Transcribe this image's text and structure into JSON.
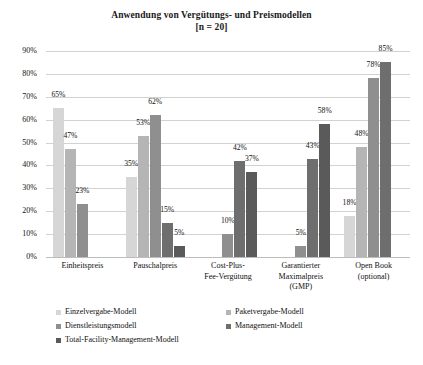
{
  "chart_data": {
    "type": "bar",
    "title": "Anwendung von Vergütungs- und Preismodellen",
    "subtitle": "[n = 20]",
    "xlabel": "",
    "ylabel": "",
    "ylim": [
      0,
      90
    ],
    "ytick_labels": [
      "0%",
      "10%",
      "20%",
      "30%",
      "40%",
      "50%",
      "60%",
      "70%",
      "80%",
      "90%"
    ],
    "ytick_values": [
      0,
      10,
      20,
      30,
      40,
      50,
      60,
      70,
      80,
      90
    ],
    "grid": true,
    "legend_position": "bottom",
    "categories": [
      "Einheitspreis",
      "Pauschalpreis",
      "Cost-Plus-\nFee-Vergütung",
      "Garantierter\nMaximalpreis\n(GMP)",
      "Open Book\n(optional)"
    ],
    "category_lines": [
      [
        "Einheitspreis"
      ],
      [
        "Pauschalpreis"
      ],
      [
        "Cost-Plus-",
        "Fee-Vergütung"
      ],
      [
        "Garantierter",
        "Maximalpreis",
        "(GMP)"
      ],
      [
        "Open Book",
        "(optional)"
      ]
    ],
    "series": [
      {
        "name": "Einzelvergabe-Modell",
        "color": "#d6d6d6",
        "values": [
          65,
          35,
          null,
          null,
          18
        ]
      },
      {
        "name": "Paketvergabe-Modell",
        "color": "#b5b5b5",
        "values": [
          47,
          53,
          null,
          null,
          48
        ]
      },
      {
        "name": "Dienstleistungsmodell",
        "color": "#8f8f8f",
        "values": [
          23,
          62,
          10,
          5,
          78
        ]
      },
      {
        "name": "Management-Modell",
        "color": "#6e6e6e",
        "values": [
          null,
          15,
          42,
          43,
          85
        ]
      },
      {
        "name": "Total-Facility-Management-Modell",
        "color": "#5a5a5a",
        "values": [
          null,
          5,
          37,
          58,
          null
        ]
      }
    ],
    "value_labels": {
      "Einheitspreis": [
        "65%",
        "47%",
        "23%"
      ],
      "Pauschalpreis": [
        "35%",
        "53%",
        "62%",
        "15%",
        "5%"
      ],
      "Cost-Plus-Fee": [
        "10%",
        "42%",
        "37%"
      ],
      "GMP": [
        "5%",
        "43%",
        "58%"
      ],
      "Open Book": [
        "18%",
        "48%",
        "78%",
        "85%"
      ]
    }
  },
  "legend": {
    "items": [
      {
        "label": "Einzelvergabe-Modell",
        "color": "#d6d6d6"
      },
      {
        "label": "Paketvergabe-Modell",
        "color": "#b5b5b5"
      },
      {
        "label": "Dienstleistungsmodell",
        "color": "#8f8f8f"
      },
      {
        "label": "Management-Modell",
        "color": "#6e6e6e"
      },
      {
        "label": "Total-Facility-Management-Modell",
        "color": "#5a5a5a"
      }
    ]
  }
}
